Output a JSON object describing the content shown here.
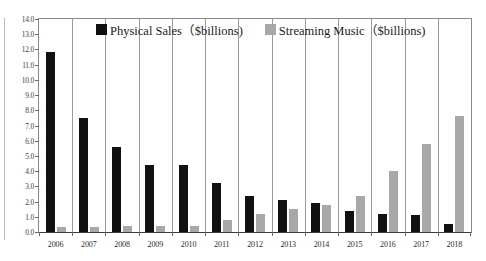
{
  "chart_data": {
    "type": "bar",
    "title": "",
    "xlabel": "",
    "ylabel": "",
    "ylim": [
      0.0,
      14.0
    ],
    "ytick_step": 1.0,
    "ytick_labels": [
      "0.0",
      "1.0",
      "2.0",
      "3.0",
      "4.0",
      "5.0",
      "6.0",
      "7.0",
      "8.0",
      "9.0",
      "10.0",
      "11.0",
      "12.0",
      "13.0",
      "14.0"
    ],
    "grid": "vertical-category-separators",
    "legend_position": "top-center-inside",
    "categories": [
      "2006",
      "2007",
      "2008",
      "2009",
      "2010",
      "2011",
      "2012",
      "2013",
      "2014",
      "2015",
      "2016",
      "2017",
      "2018"
    ],
    "series": [
      {
        "name": "Physical Sales（$billions)",
        "color": "#111111",
        "values": [
          11.8,
          7.5,
          5.6,
          4.4,
          4.4,
          3.2,
          2.4,
          2.1,
          1.9,
          1.4,
          1.2,
          1.1,
          0.5
        ]
      },
      {
        "name": "Streaming Music（$billions)",
        "color": "#a8a8a8",
        "values": [
          0.3,
          0.3,
          0.4,
          0.4,
          0.4,
          0.8,
          1.2,
          1.5,
          1.8,
          2.4,
          4.0,
          5.8,
          7.6
        ]
      }
    ]
  },
  "legend": {
    "items": [
      {
        "label": "Physical Sales（$billions)",
        "swatch": "physical"
      },
      {
        "label": "Streaming Music（$billions)",
        "swatch": "streaming"
      }
    ]
  },
  "colors": {
    "physical": "#111111",
    "streaming": "#a8a8a8",
    "axis": "#3a3a3a",
    "grid": "#9a9a9a",
    "background": "#ffffff"
  }
}
